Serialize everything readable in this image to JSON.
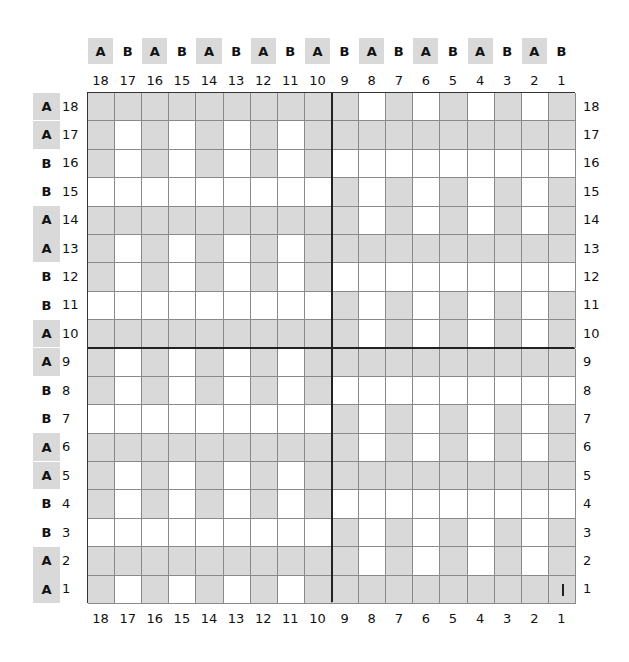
{
  "diagram": {
    "type": "weave-draft-grid",
    "size": 18,
    "colors": {
      "shaded": "#d9d9d9",
      "unshaded": "#ffffff",
      "grid_line": "#8a8a8a",
      "border": "#333333"
    },
    "columns_label_order": [
      18,
      17,
      16,
      15,
      14,
      13,
      12,
      11,
      10,
      9,
      8,
      7,
      6,
      5,
      4,
      3,
      2,
      1
    ],
    "column_letters": [
      "A",
      "B",
      "A",
      "B",
      "A",
      "B",
      "A",
      "B",
      "A",
      "B",
      "A",
      "B",
      "A",
      "B",
      "A",
      "B",
      "A",
      "B"
    ],
    "rows_label_order": [
      18,
      17,
      16,
      15,
      14,
      13,
      12,
      11,
      10,
      9,
      8,
      7,
      6,
      5,
      4,
      3,
      2,
      1
    ],
    "row_letters": [
      "A",
      "A",
      "B",
      "B",
      "A",
      "A",
      "B",
      "B",
      "A",
      "A",
      "B",
      "B",
      "A",
      "A",
      "B",
      "B",
      "A",
      "A"
    ],
    "cells": [
      "GGGGGGGGGGWGWGWGWG",
      "GWGWGWGWGGGGGGGGGG",
      "GWGWGWGWGWWWWWWWWW",
      "WWWWWWWWWGWGWGWGWG",
      "GGGGGGGGGGWGWGWGWG",
      "GWGWGWGWGGGGGGGGGG",
      "GWGWGWGWGWWWWWWWWW",
      "WWWWWWWWWGWGWGWGWG",
      "GGGGGGGGGGWGWGWGWG",
      "GWGWGWGWGGGGGGGGGG",
      "GWGWGWGWGWWWWWWWWW",
      "WWWWWWWWWGWGWGWGWG",
      "GGGGGGGGGGWGWGWGWG",
      "GWGWGWGWGGGGGGGGGG",
      "GWGWGWGWGWWWWWWWWW",
      "WWWWWWWWWGWGWGWGWG",
      "GGGGGGGGGGWGWGWGWG",
      "GWGWGWGWGGGGGGGGGG"
    ],
    "marker": {
      "row": 1,
      "col": 1,
      "glyph": "|"
    }
  }
}
